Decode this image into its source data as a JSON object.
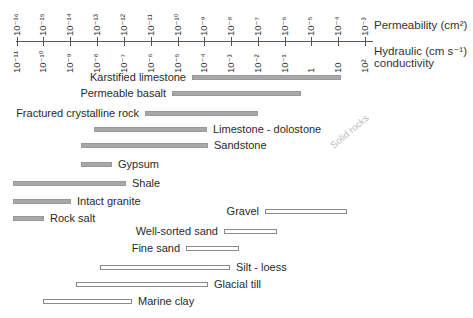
{
  "axis": {
    "permeability_title": "Permeability (cm²)",
    "conductivity_title_1": "Hydraulic  (cm s⁻¹)",
    "conductivity_title_2": "conductivity",
    "ticks": [
      {
        "x": 17,
        "perm": "10⁻¹⁶",
        "cond": "10⁻¹¹"
      },
      {
        "x": 43,
        "perm": "10⁻¹⁵",
        "cond": "10⁻¹⁰"
      },
      {
        "x": 70,
        "perm": "10⁻¹⁴",
        "cond": "10⁻⁹"
      },
      {
        "x": 97,
        "perm": "10⁻¹³",
        "cond": "10⁻⁸"
      },
      {
        "x": 124,
        "perm": "10⁻¹²",
        "cond": "10⁻⁷"
      },
      {
        "x": 151,
        "perm": "10⁻¹¹",
        "cond": "10⁻⁶"
      },
      {
        "x": 178,
        "perm": "10⁻¹⁰",
        "cond": "10⁻⁵"
      },
      {
        "x": 204,
        "perm": "10⁻⁹",
        "cond": "10⁻⁴"
      },
      {
        "x": 231,
        "perm": "10⁻⁸",
        "cond": "10⁻³"
      },
      {
        "x": 258,
        "perm": "10⁻⁷",
        "cond": "10⁻²"
      },
      {
        "x": 285,
        "perm": "10⁻⁶",
        "cond": "10⁻¹"
      },
      {
        "x": 311,
        "perm": "10⁻⁵",
        "cond": "1"
      },
      {
        "x": 338,
        "perm": "10⁻⁴",
        "cond": "10"
      },
      {
        "x": 365,
        "perm": "10⁻³",
        "cond": "10²"
      }
    ]
  },
  "solid_rocks_label": "Solid rocks",
  "rocks": [
    {
      "name": "Karstified limestone",
      "x1": 192,
      "x2": 341,
      "y": 75,
      "label_side": "left",
      "type": "solid"
    },
    {
      "name": "Permeable basalt",
      "x1": 172,
      "x2": 301,
      "y": 91,
      "label_side": "left",
      "type": "solid"
    },
    {
      "name": "Fractured crystalline rock",
      "x1": 145,
      "x2": 258,
      "y": 111,
      "label_side": "left",
      "type": "solid"
    },
    {
      "name": "Limestone - dolostone",
      "x1": 94,
      "x2": 207,
      "y": 127,
      "label_side": "right",
      "type": "solid"
    },
    {
      "name": "Sandstone",
      "x1": 81,
      "x2": 208,
      "y": 143,
      "label_side": "right",
      "type": "solid"
    },
    {
      "name": "Gypsum",
      "x1": 81,
      "x2": 112,
      "y": 162,
      "label_side": "right",
      "type": "solid"
    },
    {
      "name": "Shale",
      "x1": 13,
      "x2": 126,
      "y": 181,
      "label_side": "right",
      "type": "solid"
    },
    {
      "name": "Intact granite",
      "x1": 13,
      "x2": 71,
      "y": 199,
      "label_side": "right",
      "type": "solid"
    },
    {
      "name": "Rock salt",
      "x1": 13,
      "x2": 44,
      "y": 216,
      "label_side": "right",
      "type": "solid"
    },
    {
      "name": "Gravel",
      "x1": 265,
      "x2": 347,
      "y": 209,
      "label_side": "left",
      "type": "loose"
    },
    {
      "name": "Well-sorted sand",
      "x1": 224,
      "x2": 277,
      "y": 229,
      "label_side": "left",
      "type": "loose"
    },
    {
      "name": "Fine sand",
      "x1": 186,
      "x2": 239,
      "y": 246,
      "label_side": "left",
      "type": "loose"
    },
    {
      "name": "Silt - loess",
      "x1": 100,
      "x2": 230,
      "y": 265,
      "label_side": "right",
      "type": "loose"
    },
    {
      "name": "Glacial till",
      "x1": 76,
      "x2": 208,
      "y": 282,
      "label_side": "right",
      "type": "loose"
    },
    {
      "name": "Marine clay",
      "x1": 43,
      "x2": 132,
      "y": 299,
      "label_side": "right",
      "type": "loose"
    }
  ],
  "colors": {
    "solid_bar": "#a8a8a8",
    "loose_bar_border": "#8a8a8a",
    "axis": "#555555"
  }
}
